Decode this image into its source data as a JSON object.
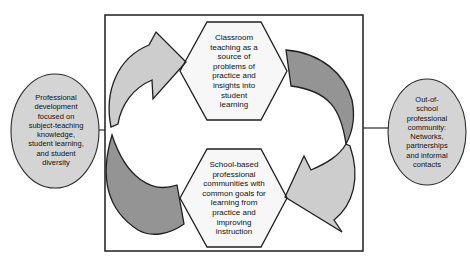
{
  "diagram": {
    "left_ellipse": {
      "text": "Professional\ndevelopment\nfocused on\nsubject-teaching\nknowledge,\nstudent learning,\nand student\ndiversity"
    },
    "right_ellipse": {
      "text": "Out-of-\nschool\nprofessional\ncommunity:\nNetworks,\npartnerships\nand informal\ncontacts"
    },
    "top_hexagon": {
      "text": "Classroom\nteaching as a\nsource of\nproblems of\npractice and\ninsights into\nstudent\nlearning"
    },
    "bottom_hexagon": {
      "text": "School-based\nprofessional\ncommunities with\ncommon goals for\nlearning from\npractice and\nimproving\ninstruction"
    },
    "colors": {
      "arrow_light": "#cdcdcd",
      "arrow_dark": "#949494",
      "ellipse_fill": "#d4d4d4",
      "hexagon_fill": "#f7f7f7",
      "outline": "#1f1f1f"
    }
  }
}
